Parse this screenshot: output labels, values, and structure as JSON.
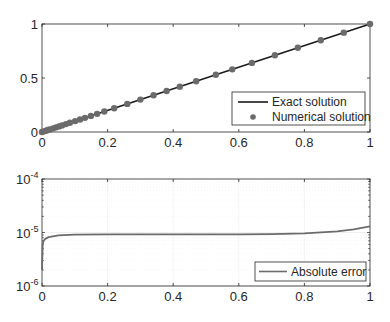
{
  "chart_data": [
    {
      "type": "line",
      "title": "",
      "xlabel": "",
      "ylabel": "",
      "xlim": [
        0,
        1
      ],
      "ylim": [
        0,
        1
      ],
      "grid": false,
      "legend_position": "southeast",
      "xticks": [
        "0",
        "0.2",
        "0.4",
        "0.6",
        "0.8",
        "1"
      ],
      "yticks": [
        "0",
        "0.5",
        "1"
      ],
      "series": [
        {
          "name": "Exact solution",
          "style": "solid line",
          "color": "#1a1a1a",
          "x": [
            0,
            1
          ],
          "y": [
            0,
            1
          ]
        },
        {
          "name": "Numerical solution",
          "style": "markers",
          "color": "#6b6b6b",
          "x": [
            0,
            0.006,
            0.012,
            0.018,
            0.024,
            0.034,
            0.043,
            0.052,
            0.061,
            0.073,
            0.085,
            0.101,
            0.116,
            0.131,
            0.149,
            0.168,
            0.19,
            0.22,
            0.26,
            0.3,
            0.34,
            0.38,
            0.42,
            0.47,
            0.53,
            0.58,
            0.64,
            0.71,
            0.78,
            0.85,
            0.92,
            1.0
          ],
          "y": [
            0,
            0.006,
            0.012,
            0.018,
            0.024,
            0.034,
            0.043,
            0.052,
            0.061,
            0.073,
            0.085,
            0.101,
            0.116,
            0.131,
            0.149,
            0.168,
            0.19,
            0.22,
            0.26,
            0.3,
            0.34,
            0.38,
            0.42,
            0.47,
            0.53,
            0.58,
            0.64,
            0.71,
            0.78,
            0.85,
            0.92,
            1.0
          ]
        }
      ]
    },
    {
      "type": "line",
      "title": "",
      "xlabel": "",
      "ylabel": "",
      "xlim": [
        0,
        1
      ],
      "ylim": [
        1e-06,
        0.0001
      ],
      "yscale": "log",
      "grid": true,
      "legend_position": "southeast",
      "xticks": [
        "0",
        "0.2",
        "0.4",
        "0.6",
        "0.8",
        "1"
      ],
      "yticks": [
        "10^-6",
        "10^-5",
        "10^-4"
      ],
      "series": [
        {
          "name": "Absolute error",
          "style": "solid line",
          "color": "#6b6b6b",
          "x": [
            0,
            0.002,
            0.005,
            0.01,
            0.02,
            0.05,
            0.1,
            0.2,
            0.3,
            0.4,
            0.5,
            0.6,
            0.7,
            0.8,
            0.9,
            0.95,
            1.0
          ],
          "y": [
            2e-06,
            6e-06,
            7e-06,
            7.6e-06,
            8.2e-06,
            8.8e-06,
            9.1e-06,
            9.2e-06,
            9.2e-06,
            9.2e-06,
            9.2e-06,
            9.2e-06,
            9.3e-06,
            9.6e-06,
            1.05e-05,
            1.14e-05,
            1.3e-05
          ]
        }
      ]
    }
  ],
  "labels": {
    "top": {
      "xticks": [
        "0",
        "0.2",
        "0.4",
        "0.6",
        "0.8",
        "1"
      ],
      "yticks": [
        "0",
        "0.5",
        "1"
      ],
      "legend": [
        "Exact solution",
        "Numerical solution"
      ]
    },
    "bottom": {
      "xticks": [
        "0",
        "0.2",
        "0.4",
        "0.6",
        "0.8",
        "1"
      ],
      "ytick_base": [
        "10",
        "10",
        "10"
      ],
      "ytick_exp": [
        "-6",
        "-5",
        "-4"
      ],
      "legend": [
        "Absolute error"
      ]
    }
  }
}
